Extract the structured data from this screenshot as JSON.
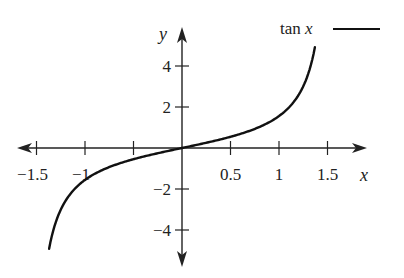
{
  "chart_data": {
    "type": "line",
    "title": "",
    "xlabel": "x",
    "ylabel": "y",
    "xlim": [
      -1.6,
      1.6
    ],
    "ylim": [
      -5.2,
      5.8
    ],
    "grid": false,
    "legend_position": "top-right",
    "x_ticks": [
      -1.5,
      -1,
      -0.5,
      0.5,
      1,
      1.5
    ],
    "x_tick_labels": [
      "−1.5",
      "−1",
      "",
      "0.5",
      "1",
      "1.5"
    ],
    "y_ticks": [
      4,
      2,
      -2,
      -4
    ],
    "y_tick_labels": [
      "4",
      "2",
      "−2",
      "−4"
    ],
    "series": [
      {
        "name": "tan x",
        "color": "#111111",
        "function": "tan(x)",
        "x_range": [
          -1.37,
          1.37
        ],
        "x": [
          -1.37,
          -1.3,
          -1.2,
          -1.0,
          -0.8,
          -0.6,
          -0.4,
          -0.2,
          0,
          0.2,
          0.4,
          0.6,
          0.8,
          1.0,
          1.2,
          1.3,
          1.37
        ],
        "values": [
          -4.92,
          -3.6,
          -2.57,
          -1.56,
          -1.03,
          -0.68,
          -0.42,
          -0.2,
          0,
          0.2,
          0.42,
          0.68,
          1.03,
          1.56,
          2.57,
          3.6,
          4.92
        ]
      }
    ],
    "legend": [
      {
        "label": "tan x",
        "style": "solid line"
      }
    ]
  },
  "legend": {
    "label_plain": "tan ",
    "label_var": "x"
  },
  "axes": {
    "x_label": "x",
    "y_label": "y"
  }
}
